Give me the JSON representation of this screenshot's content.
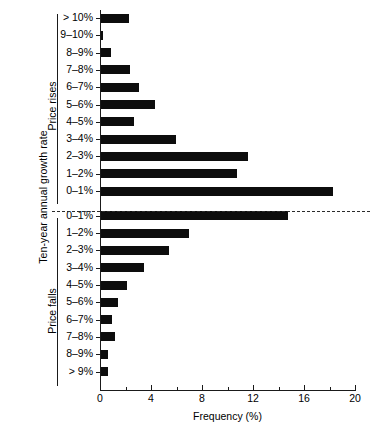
{
  "chart_data": {
    "type": "bar",
    "orientation": "horizontal",
    "title": "",
    "xlabel": "Frequency (%)",
    "ylabel": "Ten-year annual growth rate",
    "xlim": [
      0,
      20
    ],
    "xticks": [
      0,
      4,
      8,
      12,
      16,
      20
    ],
    "xtick_labels": [
      "0",
      "4",
      "8",
      "12",
      "16",
      "20"
    ],
    "xminor_ticks": [
      2,
      6,
      10,
      14,
      18
    ],
    "grid": false,
    "legend": false,
    "groups": [
      {
        "name": "Price rises",
        "label": "Price rises"
      },
      {
        "name": "Price falls",
        "label": "Price falls"
      }
    ],
    "divider": {
      "style": "dashed",
      "between": [
        "Price rises 0-1%",
        "Price falls 0-1%"
      ]
    },
    "categories": [
      "> 10%",
      "9–10%",
      "8–9%",
      "7–8%",
      "6–7%",
      "5–6%",
      "4–5%",
      "3–4%",
      "2–3%",
      "1–2%",
      "0–1%",
      "0–1%",
      "1–2%",
      "2–3%",
      "3–4%",
      "4–5%",
      "5–6%",
      "6–7%",
      "7–8%",
      "8–9%",
      "> 9%"
    ],
    "values": [
      2.2,
      0.15,
      0.8,
      2.3,
      3.0,
      4.2,
      2.6,
      5.9,
      11.5,
      10.7,
      18.2,
      14.7,
      6.9,
      5.3,
      3.4,
      2.0,
      1.3,
      0.9,
      1.1,
      0.55,
      0.55
    ],
    "group_of": [
      "rises",
      "rises",
      "rises",
      "rises",
      "rises",
      "rises",
      "rises",
      "rises",
      "rises",
      "rises",
      "rises",
      "falls",
      "falls",
      "falls",
      "falls",
      "falls",
      "falls",
      "falls",
      "falls",
      "falls",
      "falls"
    ],
    "bar_color": "#0d0d0d",
    "axis_color": "#1a1a1a",
    "background": "#ffffff"
  }
}
